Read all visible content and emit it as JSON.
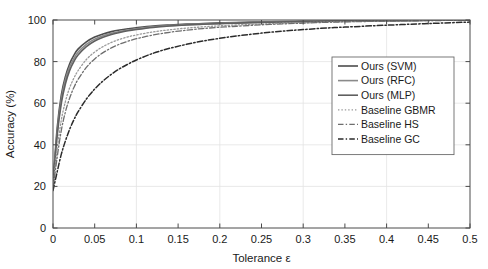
{
  "chart_data": {
    "type": "line",
    "title": "",
    "xlabel": "Tolerance ε",
    "ylabel": "Accuracy (%)",
    "xlim": [
      0,
      0.5
    ],
    "ylim": [
      0,
      100
    ],
    "xticks": [
      "0",
      "0.05",
      "0.1",
      "0.15",
      "0.2",
      "0.25",
      "0.3",
      "0.35",
      "0.4",
      "0.45",
      "0.5"
    ],
    "xtick_values": [
      0,
      0.05,
      0.1,
      0.15,
      0.2,
      0.25,
      0.3,
      0.35,
      0.4,
      0.45,
      0.5
    ],
    "yticks": [
      "0",
      "20",
      "40",
      "60",
      "80",
      "100"
    ],
    "ytick_values": [
      0,
      20,
      40,
      60,
      80,
      100
    ],
    "grid": true,
    "legend_position": "center-right",
    "x": [
      0,
      0.005,
      0.01,
      0.015,
      0.02,
      0.025,
      0.03,
      0.04,
      0.05,
      0.06,
      0.07,
      0.08,
      0.09,
      0.1,
      0.12,
      0.14,
      0.16,
      0.18,
      0.2,
      0.22,
      0.25,
      0.28,
      0.3,
      0.33,
      0.35,
      0.4,
      0.45,
      0.5
    ],
    "series": [
      {
        "name": "Ours (SVM)",
        "style": "solid",
        "color": "#4d4d4d",
        "width": 1.6,
        "values": [
          21,
          48,
          64,
          73,
          79,
          83,
          86,
          89.5,
          91.8,
          93.3,
          94.4,
          95.2,
          95.8,
          96.3,
          97.1,
          97.6,
          98.0,
          98.3,
          98.6,
          98.8,
          99.05,
          99.25,
          99.35,
          99.5,
          99.6,
          99.75,
          99.88,
          100
        ]
      },
      {
        "name": "Ours (RFC)",
        "style": "solid",
        "color": "#8a8a8a",
        "width": 1.6,
        "values": [
          21,
          46,
          62,
          71.5,
          77.5,
          81.5,
          84.5,
          88.3,
          90.8,
          92.4,
          93.6,
          94.5,
          95.2,
          95.8,
          96.7,
          97.3,
          97.8,
          98.1,
          98.4,
          98.65,
          98.95,
          99.15,
          99.28,
          99.45,
          99.55,
          99.72,
          99.86,
          100
        ]
      },
      {
        "name": "Ours (MLP)",
        "style": "solid",
        "color": "#5f5f5f",
        "width": 1.6,
        "values": [
          21,
          44.5,
          60,
          69.5,
          75.8,
          80,
          83.2,
          87.2,
          89.9,
          91.7,
          93.0,
          94.0,
          94.8,
          95.4,
          96.4,
          97.1,
          97.6,
          97.95,
          98.25,
          98.5,
          98.85,
          99.08,
          99.2,
          99.4,
          99.5,
          99.7,
          99.85,
          100
        ]
      },
      {
        "name": "Baseline GBMR",
        "style": "dotted",
        "color": "#9a9a9a",
        "width": 1.3,
        "values": [
          20,
          38,
          52,
          61,
          67.5,
          72,
          75.6,
          81,
          84.6,
          87.2,
          89.2,
          90.7,
          91.9,
          92.8,
          94.3,
          95.3,
          96.1,
          96.7,
          97.2,
          97.6,
          98.1,
          98.5,
          98.7,
          99.0,
          99.2,
          99.5,
          99.75,
          99.95
        ]
      },
      {
        "name": "Baseline HS",
        "style": "dashdot",
        "color": "#6e6e6e",
        "width": 1.3,
        "values": [
          19,
          34,
          47,
          56,
          62.5,
          67.5,
          71.4,
          77.2,
          81.3,
          84.3,
          86.6,
          88.4,
          89.8,
          91.0,
          92.8,
          94.1,
          95.1,
          95.9,
          96.5,
          97.0,
          97.7,
          98.2,
          98.5,
          98.9,
          99.1,
          99.45,
          99.7,
          99.9
        ]
      },
      {
        "name": "Baseline GC",
        "style": "dashdot",
        "color": "#2b2b2b",
        "width": 1.5,
        "values": [
          18,
          27,
          35.5,
          42,
          47.5,
          52,
          55.8,
          62,
          66.8,
          70.7,
          73.9,
          76.6,
          78.8,
          80.8,
          84.0,
          86.4,
          88.3,
          89.9,
          91.2,
          92.3,
          93.7,
          94.8,
          95.4,
          96.2,
          96.6,
          97.5,
          98.3,
          99.0
        ]
      }
    ]
  }
}
